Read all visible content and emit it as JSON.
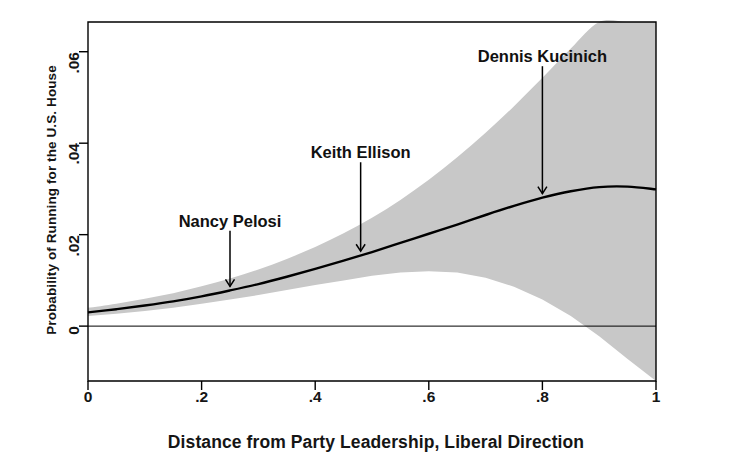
{
  "chart_data": {
    "type": "line",
    "title": "",
    "xlabel": "Distance from Party Leadership, Liberal Direction",
    "ylabel": "Probability of Running for the U.S. House",
    "xlim": [
      0,
      1
    ],
    "ylim": [
      -0.012,
      0.0665
    ],
    "grid": false,
    "legend": "none",
    "xticks": [
      "0",
      ".2",
      ".4",
      ".6",
      ".8",
      "1"
    ],
    "xtick_values": [
      0,
      0.2,
      0.4,
      0.6,
      0.8,
      1
    ],
    "yticks": [
      "0",
      ".02",
      ".04",
      ".06"
    ],
    "ytick_values": [
      0,
      0.02,
      0.04,
      0.06
    ],
    "zero_reference_line": 0,
    "series": [
      {
        "name": "Predicted probability",
        "kind": "line",
        "x": [
          0,
          0.05,
          0.1,
          0.15,
          0.2,
          0.25,
          0.3,
          0.35,
          0.4,
          0.45,
          0.5,
          0.55,
          0.6,
          0.65,
          0.7,
          0.75,
          0.8,
          0.85,
          0.9,
          0.95,
          1
        ],
        "values": [
          0.003,
          0.0037,
          0.0045,
          0.0054,
          0.0065,
          0.0078,
          0.0092,
          0.0108,
          0.0125,
          0.0143,
          0.0162,
          0.0182,
          0.0202,
          0.0222,
          0.0243,
          0.0263,
          0.0281,
          0.0295,
          0.0304,
          0.0305,
          0.0299
        ]
      },
      {
        "name": "95% confidence interval upper bound",
        "kind": "band-upper",
        "x": [
          0,
          0.05,
          0.1,
          0.15,
          0.2,
          0.25,
          0.3,
          0.35,
          0.4,
          0.45,
          0.5,
          0.55,
          0.6,
          0.65,
          0.7,
          0.75,
          0.8,
          0.85,
          0.9,
          0.95,
          1
        ],
        "values": [
          0.004,
          0.0049,
          0.006,
          0.0072,
          0.0087,
          0.0104,
          0.0124,
          0.0147,
          0.0173,
          0.0203,
          0.0237,
          0.0276,
          0.032,
          0.0369,
          0.0423,
          0.0481,
          0.0543,
          0.0607,
          0.0665,
          0.0665,
          0.0665
        ]
      },
      {
        "name": "95% confidence interval lower bound",
        "kind": "band-lower",
        "x": [
          0,
          0.05,
          0.1,
          0.15,
          0.2,
          0.25,
          0.3,
          0.35,
          0.4,
          0.45,
          0.5,
          0.55,
          0.6,
          0.65,
          0.7,
          0.75,
          0.8,
          0.85,
          0.9,
          0.95,
          1
        ],
        "values": [
          0.0022,
          0.0027,
          0.0033,
          0.004,
          0.0049,
          0.0058,
          0.0068,
          0.0079,
          0.009,
          0.01,
          0.011,
          0.0117,
          0.012,
          0.0117,
          0.0106,
          0.0086,
          0.0058,
          0.0022,
          -0.0022,
          -0.0072,
          -0.0122
        ]
      }
    ],
    "annotations": [
      {
        "label": "Nancy Pelosi",
        "x": 0.25,
        "y": 0.0078,
        "text_y": 0.0228
      },
      {
        "label": "Keith Ellison",
        "x": 0.48,
        "y": 0.0155,
        "text_y": 0.0378
      },
      {
        "label": "Dennis Kucinich",
        "x": 0.8,
        "y": 0.0281,
        "text_y": 0.0588
      }
    ],
    "colors": {
      "band_fill": "#c8c8c8",
      "line": "#000000",
      "axis": "#000000",
      "background": "#ffffff",
      "text": "#111111"
    }
  }
}
